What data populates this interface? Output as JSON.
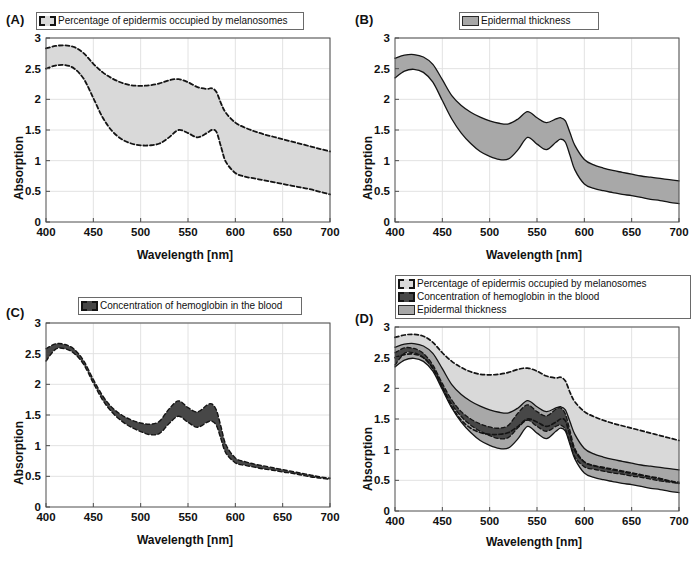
{
  "figure": {
    "panels": [
      {
        "id": "A",
        "label": "(A)",
        "legend": [
          {
            "key": "melanosomes",
            "label": "Percentage of epidermis occupied by melanosomes",
            "swatch": "dashed-lightgray"
          }
        ]
      },
      {
        "id": "B",
        "label": "(B)",
        "legend": [
          {
            "key": "epidermal",
            "label": "Epidermal thickness",
            "swatch": "solid-gray"
          }
        ]
      },
      {
        "id": "C",
        "label": "(C)",
        "legend": [
          {
            "key": "hemoglobin",
            "label": "Concentration of hemoglobin in the blood",
            "swatch": "dashed-darkgray"
          }
        ]
      },
      {
        "id": "D",
        "label": "(D)",
        "legend": [
          {
            "key": "melanosomes",
            "label": "Percentage of epidermis occupied by melanosomes",
            "swatch": "dashed-lightgray"
          },
          {
            "key": "hemoglobin",
            "label": "Concentration of hemoglobin in the blood",
            "swatch": "dashed-darkgray"
          },
          {
            "key": "epidermal",
            "label": "Epidermal thickness",
            "swatch": "solid-gray"
          }
        ]
      }
    ],
    "colors": {
      "fill_melanosomes": "#d9d9d9",
      "fill_epidermal": "#a8a8a8",
      "fill_hemoglobin": "#474747",
      "axis": "#4d4d4d",
      "grid": "#e2e2e2",
      "curve": "#141414"
    }
  },
  "chart_data": [
    {
      "type": "area",
      "panel": "A",
      "title": "",
      "xlabel": "Wavelength [nm]",
      "ylabel": "Absorption",
      "xlim": [
        400,
        700
      ],
      "ylim": [
        0,
        3
      ],
      "xticks": [
        400,
        450,
        500,
        550,
        600,
        650,
        700
      ],
      "yticks": [
        0,
        0.5,
        1,
        1.5,
        2,
        2.5,
        3
      ],
      "grid": true,
      "legend_position": "top-center",
      "x": [
        400,
        410,
        420,
        430,
        440,
        450,
        460,
        470,
        480,
        490,
        500,
        510,
        520,
        530,
        540,
        550,
        560,
        570,
        575,
        580,
        585,
        590,
        600,
        610,
        620,
        630,
        640,
        650,
        660,
        670,
        680,
        690,
        700
      ],
      "series": [
        {
          "name": "Percentage of epidermis occupied by melanosomes upper",
          "values": [
            2.83,
            2.87,
            2.88,
            2.85,
            2.75,
            2.58,
            2.44,
            2.34,
            2.27,
            2.23,
            2.22,
            2.23,
            2.26,
            2.31,
            2.33,
            2.28,
            2.2,
            2.17,
            2.18,
            2.12,
            1.93,
            1.78,
            1.62,
            1.54,
            1.48,
            1.43,
            1.39,
            1.35,
            1.31,
            1.27,
            1.23,
            1.19,
            1.15
          ],
          "style": "dashed"
        },
        {
          "name": "Percentage of epidermis occupied by melanosomes lower",
          "values": [
            2.5,
            2.55,
            2.56,
            2.5,
            2.33,
            2.02,
            1.7,
            1.48,
            1.35,
            1.28,
            1.25,
            1.25,
            1.28,
            1.38,
            1.5,
            1.45,
            1.38,
            1.45,
            1.5,
            1.47,
            1.22,
            0.98,
            0.8,
            0.74,
            0.71,
            0.68,
            0.65,
            0.62,
            0.59,
            0.56,
            0.53,
            0.49,
            0.45
          ],
          "style": "dashed"
        }
      ]
    },
    {
      "type": "area",
      "panel": "B",
      "title": "",
      "xlabel": "Wavelength [nm]",
      "ylabel": "Absorption",
      "xlim": [
        400,
        700
      ],
      "ylim": [
        0,
        3
      ],
      "xticks": [
        400,
        450,
        500,
        550,
        600,
        650,
        700
      ],
      "yticks": [
        0,
        0.5,
        1,
        1.5,
        2,
        2.5,
        3
      ],
      "grid": true,
      "legend_position": "top-center",
      "x": [
        400,
        410,
        420,
        430,
        440,
        450,
        460,
        470,
        480,
        490,
        500,
        510,
        520,
        530,
        540,
        550,
        560,
        570,
        575,
        580,
        585,
        590,
        600,
        610,
        620,
        630,
        640,
        650,
        660,
        670,
        680,
        690,
        700
      ],
      "series": [
        {
          "name": "Epidermal thickness upper",
          "values": [
            2.67,
            2.72,
            2.73,
            2.69,
            2.57,
            2.32,
            2.06,
            1.9,
            1.79,
            1.71,
            1.65,
            1.61,
            1.6,
            1.68,
            1.8,
            1.7,
            1.62,
            1.68,
            1.7,
            1.65,
            1.45,
            1.25,
            1.02,
            0.93,
            0.88,
            0.84,
            0.81,
            0.78,
            0.75,
            0.73,
            0.71,
            0.69,
            0.67
          ],
          "style": "solid"
        },
        {
          "name": "Epidermal thickness lower",
          "values": [
            2.35,
            2.46,
            2.49,
            2.44,
            2.28,
            1.98,
            1.68,
            1.45,
            1.28,
            1.15,
            1.07,
            1.02,
            1.03,
            1.18,
            1.38,
            1.27,
            1.18,
            1.3,
            1.35,
            1.3,
            1.08,
            0.85,
            0.62,
            0.55,
            0.51,
            0.48,
            0.45,
            0.43,
            0.4,
            0.37,
            0.35,
            0.32,
            0.3
          ],
          "style": "solid"
        }
      ]
    },
    {
      "type": "area",
      "panel": "C",
      "title": "",
      "xlabel": "Wavelength [nm]",
      "ylabel": "Absorption",
      "xlim": [
        400,
        700
      ],
      "ylim": [
        0,
        3
      ],
      "xticks": [
        400,
        450,
        500,
        550,
        600,
        650,
        700
      ],
      "yticks": [
        0,
        0.5,
        1,
        1.5,
        2,
        2.5,
        3
      ],
      "grid": true,
      "legend_position": "top-center",
      "x": [
        400,
        410,
        420,
        430,
        440,
        450,
        460,
        470,
        480,
        490,
        500,
        510,
        520,
        530,
        540,
        550,
        560,
        570,
        575,
        580,
        585,
        590,
        600,
        610,
        620,
        630,
        640,
        650,
        660,
        670,
        680,
        690,
        700
      ],
      "series": [
        {
          "name": "Concentration of hemoglobin in the blood upper",
          "values": [
            2.58,
            2.66,
            2.65,
            2.57,
            2.38,
            2.08,
            1.81,
            1.62,
            1.5,
            1.42,
            1.37,
            1.35,
            1.4,
            1.6,
            1.73,
            1.62,
            1.55,
            1.66,
            1.68,
            1.58,
            1.3,
            1.02,
            0.8,
            0.74,
            0.7,
            0.67,
            0.64,
            0.61,
            0.58,
            0.55,
            0.52,
            0.49,
            0.47
          ],
          "style": "dashed"
        },
        {
          "name": "Concentration of hemoglobin in the blood lower",
          "values": [
            2.38,
            2.57,
            2.58,
            2.5,
            2.32,
            2.02,
            1.74,
            1.54,
            1.4,
            1.3,
            1.23,
            1.18,
            1.2,
            1.36,
            1.48,
            1.38,
            1.3,
            1.38,
            1.4,
            1.33,
            1.1,
            0.88,
            0.72,
            0.68,
            0.65,
            0.62,
            0.6,
            0.57,
            0.55,
            0.52,
            0.49,
            0.47,
            0.45
          ],
          "style": "dashed"
        }
      ]
    },
    {
      "type": "area",
      "panel": "D",
      "title": "",
      "xlabel": "Wavelength [nm]",
      "ylabel": "Absorption",
      "xlim": [
        400,
        700
      ],
      "ylim": [
        0,
        3
      ],
      "xticks": [
        400,
        450,
        500,
        550,
        600,
        650,
        700
      ],
      "yticks": [
        0,
        0.5,
        1,
        1.5,
        2,
        2.5,
        3
      ],
      "grid": true,
      "legend_position": "top-right",
      "x": [
        400,
        410,
        420,
        430,
        440,
        450,
        460,
        470,
        480,
        490,
        500,
        510,
        520,
        530,
        540,
        550,
        560,
        570,
        575,
        580,
        585,
        590,
        600,
        610,
        620,
        630,
        640,
        650,
        660,
        670,
        680,
        690,
        700
      ],
      "series": [
        {
          "name": "Percentage of epidermis occupied by melanosomes upper",
          "values": [
            2.83,
            2.87,
            2.88,
            2.85,
            2.75,
            2.58,
            2.44,
            2.34,
            2.27,
            2.23,
            2.22,
            2.23,
            2.26,
            2.31,
            2.33,
            2.28,
            2.2,
            2.17,
            2.18,
            2.12,
            1.93,
            1.78,
            1.62,
            1.54,
            1.48,
            1.43,
            1.39,
            1.35,
            1.31,
            1.27,
            1.23,
            1.19,
            1.15
          ],
          "style": "dashed"
        },
        {
          "name": "Epidermal thickness upper",
          "values": [
            2.67,
            2.72,
            2.73,
            2.69,
            2.57,
            2.32,
            2.06,
            1.9,
            1.79,
            1.71,
            1.65,
            1.61,
            1.6,
            1.68,
            1.8,
            1.7,
            1.62,
            1.68,
            1.7,
            1.65,
            1.45,
            1.25,
            1.02,
            0.93,
            0.88,
            0.84,
            0.81,
            0.78,
            0.75,
            0.73,
            0.71,
            0.69,
            0.67
          ],
          "style": "solid"
        },
        {
          "name": "Concentration of hemoglobin in the blood upper",
          "values": [
            2.58,
            2.66,
            2.65,
            2.57,
            2.38,
            2.08,
            1.81,
            1.62,
            1.5,
            1.42,
            1.37,
            1.35,
            1.4,
            1.6,
            1.73,
            1.62,
            1.55,
            1.66,
            1.68,
            1.58,
            1.3,
            1.02,
            0.8,
            0.74,
            0.7,
            0.67,
            0.64,
            0.61,
            0.58,
            0.55,
            0.52,
            0.49,
            0.47
          ],
          "style": "dashed"
        },
        {
          "name": "Concentration of hemoglobin in the blood lower",
          "values": [
            2.38,
            2.57,
            2.58,
            2.5,
            2.32,
            2.02,
            1.74,
            1.54,
            1.4,
            1.3,
            1.23,
            1.18,
            1.2,
            1.36,
            1.48,
            1.38,
            1.3,
            1.38,
            1.4,
            1.33,
            1.1,
            0.88,
            0.72,
            0.68,
            0.65,
            0.62,
            0.6,
            0.57,
            0.55,
            0.52,
            0.49,
            0.47,
            0.45
          ],
          "style": "dashed"
        },
        {
          "name": "Epidermal thickness lower",
          "values": [
            2.35,
            2.46,
            2.49,
            2.44,
            2.28,
            1.98,
            1.68,
            1.45,
            1.28,
            1.15,
            1.07,
            1.02,
            1.03,
            1.18,
            1.38,
            1.27,
            1.18,
            1.3,
            1.35,
            1.3,
            1.08,
            0.85,
            0.62,
            0.55,
            0.51,
            0.48,
            0.45,
            0.43,
            0.4,
            0.37,
            0.35,
            0.32,
            0.3
          ],
          "style": "solid"
        },
        {
          "name": "Percentage of epidermis occupied by melanosomes lower",
          "values": [
            2.5,
            2.55,
            2.56,
            2.5,
            2.33,
            2.02,
            1.7,
            1.48,
            1.35,
            1.28,
            1.25,
            1.25,
            1.28,
            1.38,
            1.5,
            1.45,
            1.38,
            1.45,
            1.5,
            1.47,
            1.22,
            0.98,
            0.8,
            0.74,
            0.71,
            0.68,
            0.65,
            0.62,
            0.59,
            0.56,
            0.53,
            0.49,
            0.45
          ],
          "style": "dashed"
        }
      ]
    }
  ]
}
